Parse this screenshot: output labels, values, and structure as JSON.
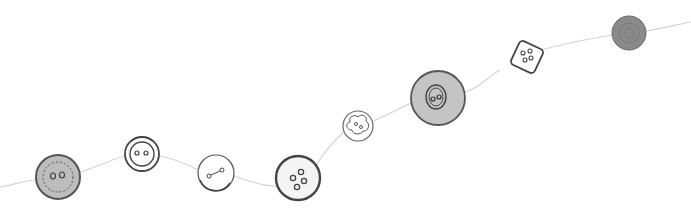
{
  "illustration": {
    "alt": "Sketch of sewing buttons strung along a thread",
    "thread_color": "#d4d4d4",
    "stroke_color": "#555555",
    "buttons": [
      {
        "name": "button-gray-fringed",
        "cx": 58,
        "cy": 177,
        "r": 22,
        "fill": "#bdbdbd",
        "holes": 2,
        "shape": "circle"
      },
      {
        "name": "button-white-rimmed",
        "cx": 142,
        "cy": 154,
        "r": 17,
        "fill": "#ffffff",
        "holes": 2,
        "shape": "circle"
      },
      {
        "name": "button-white-slit",
        "cx": 216,
        "cy": 173,
        "r": 18,
        "fill": "#ffffff",
        "holes": 2,
        "shape": "circle"
      },
      {
        "name": "button-white-four-hole",
        "cx": 298,
        "cy": 178,
        "r": 22,
        "fill": "#f4f4f4",
        "holes": 4,
        "shape": "circle"
      },
      {
        "name": "button-flower",
        "cx": 358,
        "cy": 126,
        "r": 15,
        "fill": "#ffffff",
        "holes": 2,
        "shape": "flower"
      },
      {
        "name": "button-gray-large",
        "cx": 438,
        "cy": 98,
        "r": 27,
        "fill": "#c4c4c4",
        "holes": 2,
        "shape": "circle"
      },
      {
        "name": "button-square",
        "cx": 527,
        "cy": 57,
        "r": 14,
        "fill": "#ffffff",
        "holes": 4,
        "shape": "square"
      },
      {
        "name": "button-dark-gray",
        "cx": 629,
        "cy": 33,
        "r": 17,
        "fill": "#8a8a8a",
        "holes": 0,
        "shape": "circle"
      }
    ]
  }
}
